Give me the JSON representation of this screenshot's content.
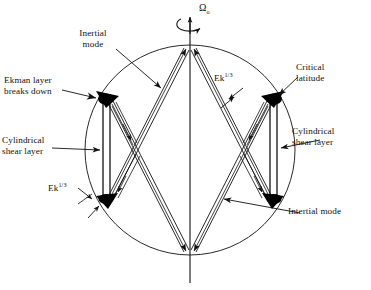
{
  "figure": {
    "type": "scientific-schematic",
    "background_color": "#ffffff",
    "line_color": "#111111",
    "fill_color": "#000000"
  },
  "labels": {
    "rotation_rate": "Ω",
    "rotation_rate_subscript": "o",
    "inertial_mode": "Inertial\nmode",
    "ekman_breakdown": "Ekman layer\nbreaks down",
    "cylindrical_shear_left": "Cylindrical\nshear layer",
    "cylindrical_shear_right": "Cylindrical\nshear layer",
    "critical_latitude": "Critical\nlatitude",
    "intertial_mode": "Intertial mode",
    "ek_scale_left": "Ek",
    "ek_scale_left_exp": "1/3",
    "ek_scale_mid": "Ek",
    "ek_scale_mid_exp": "1/3"
  },
  "geometry": {
    "sphere_center_x": 190,
    "sphere_center_y": 150,
    "sphere_radius": 105,
    "axis_top_y": 18,
    "axis_bottom_y": 283,
    "critical_points": [
      {
        "name": "upper-left",
        "x": 106,
        "y": 99
      },
      {
        "name": "lower-left",
        "x": 106,
        "y": 201
      },
      {
        "name": "upper-right",
        "x": 274,
        "y": 99
      },
      {
        "name": "lower-right",
        "x": 274,
        "y": 201
      }
    ],
    "shear_layer_width": 6,
    "pole_north": {
      "x": 190,
      "y": 45
    },
    "pole_south": {
      "x": 190,
      "y": 255
    }
  },
  "icons": {
    "rotation_arrow": "curved-rotation-arrow",
    "axis": "rotation-axis-line",
    "pointer": "arrow-pointer"
  }
}
